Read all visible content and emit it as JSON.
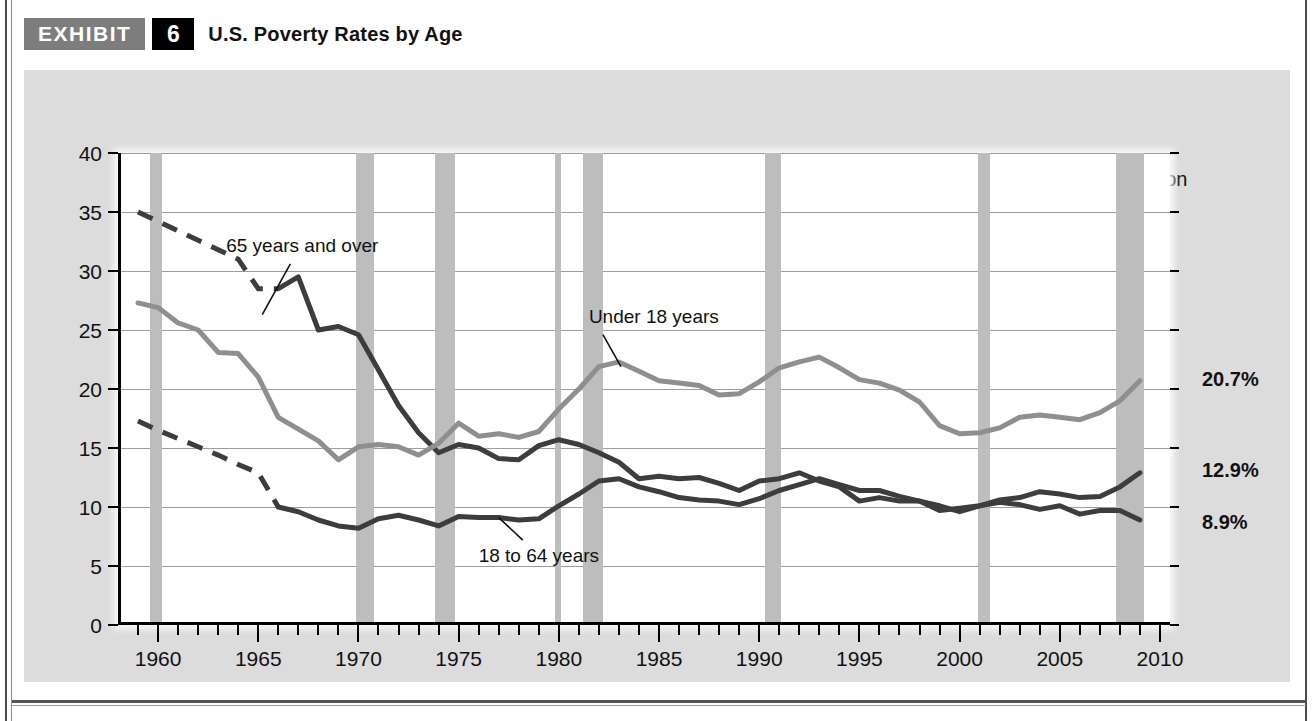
{
  "header": {
    "exhibit_label": "EXHIBIT",
    "exhibit_number": "6",
    "title": "U.S. Poverty Rates by Age"
  },
  "legend": {
    "recession_label": "Recession",
    "recession_color": "#bdbdbd"
  },
  "annotations": {
    "axis_note": "Percent",
    "series_65": "65 years and over",
    "series_under18": "Under 18 years",
    "series_18to64": "18 to 64 years",
    "end_under18": "20.7%",
    "end_18to64": "12.9%",
    "end_65": "8.9%"
  },
  "chart_data": {
    "type": "line",
    "title": "U.S. Poverty Rates by Age",
    "xlabel": "",
    "ylabel": "Percent",
    "xlim": [
      1958,
      2010.5
    ],
    "ylim": [
      0,
      40
    ],
    "ytick_values": [
      0,
      5,
      10,
      15,
      20,
      25,
      30,
      35,
      40
    ],
    "xtick_values": [
      1960,
      1965,
      1970,
      1975,
      1980,
      1985,
      1990,
      1995,
      2000,
      2005,
      2010
    ],
    "xtick_labels": [
      "1960",
      "1965",
      "1970",
      "1975",
      "1980",
      "1985",
      "1990",
      "1995",
      "2000",
      "2005",
      "2010"
    ],
    "grid": "horizontal",
    "legend_position": "top-right",
    "series": [
      {
        "name": "65 years and over",
        "color": "#3d3d3d",
        "width": 5,
        "dashed_until": 1966,
        "end_value_label": "8.9%",
        "x": [
          1959,
          1960,
          1961,
          1962,
          1963,
          1964,
          1965,
          1966,
          1967,
          1968,
          1969,
          1970,
          1971,
          1972,
          1973,
          1974,
          1975,
          1976,
          1977,
          1978,
          1979,
          1980,
          1981,
          1982,
          1983,
          1984,
          1985,
          1986,
          1987,
          1988,
          1989,
          1990,
          1991,
          1992,
          1993,
          1994,
          1995,
          1996,
          1997,
          1998,
          1999,
          2000,
          2001,
          2002,
          2003,
          2004,
          2005,
          2006,
          2007,
          2008,
          2009
        ],
        "y": [
          35.0,
          34.2,
          33.4,
          32.6,
          31.8,
          31.0,
          28.5,
          28.5,
          29.5,
          25.0,
          25.3,
          24.6,
          21.6,
          18.6,
          16.3,
          14.6,
          15.3,
          15.0,
          14.1,
          14.0,
          15.2,
          15.7,
          15.3,
          14.6,
          13.8,
          12.4,
          12.6,
          12.4,
          12.5,
          12.0,
          11.4,
          12.2,
          12.4,
          12.9,
          12.2,
          11.7,
          10.5,
          10.8,
          10.5,
          10.5,
          9.7,
          9.9,
          10.1,
          10.4,
          10.2,
          9.8,
          10.1,
          9.4,
          9.7,
          9.7,
          8.9
        ]
      },
      {
        "name": "Under 18 years",
        "color": "#8f8f8f",
        "width": 5,
        "dashed_until": null,
        "end_value_label": "20.7%",
        "x": [
          1959,
          1960,
          1961,
          1962,
          1963,
          1964,
          1965,
          1966,
          1967,
          1968,
          1969,
          1970,
          1971,
          1972,
          1973,
          1974,
          1975,
          1976,
          1977,
          1978,
          1979,
          1980,
          1981,
          1982,
          1983,
          1984,
          1985,
          1986,
          1987,
          1988,
          1989,
          1990,
          1991,
          1992,
          1993,
          1994,
          1995,
          1996,
          1997,
          1998,
          1999,
          2000,
          2001,
          2002,
          2003,
          2004,
          2005,
          2006,
          2007,
          2008,
          2009
        ],
        "y": [
          27.3,
          26.9,
          25.6,
          25.0,
          23.1,
          23.0,
          21.0,
          17.6,
          16.6,
          15.6,
          14.0,
          15.1,
          15.3,
          15.1,
          14.4,
          15.4,
          17.1,
          16.0,
          16.2,
          15.9,
          16.4,
          18.3,
          20.0,
          21.9,
          22.3,
          21.5,
          20.7,
          20.5,
          20.3,
          19.5,
          19.6,
          20.6,
          21.8,
          22.3,
          22.7,
          21.8,
          20.8,
          20.5,
          19.9,
          18.9,
          16.9,
          16.2,
          16.3,
          16.7,
          17.6,
          17.8,
          17.6,
          17.4,
          18.0,
          19.0,
          20.7
        ]
      },
      {
        "name": "18 to 64 years",
        "color": "#3d3d3d",
        "width": 5,
        "dashed_until": 1966,
        "end_value_label": "12.9%",
        "x": [
          1959,
          1960,
          1961,
          1962,
          1963,
          1964,
          1965,
          1966,
          1967,
          1968,
          1969,
          1970,
          1971,
          1972,
          1973,
          1974,
          1975,
          1976,
          1977,
          1978,
          1979,
          1980,
          1981,
          1982,
          1983,
          1984,
          1985,
          1986,
          1987,
          1988,
          1989,
          1990,
          1991,
          1992,
          1993,
          1994,
          1995,
          1996,
          1997,
          1998,
          1999,
          2000,
          2001,
          2002,
          2003,
          2004,
          2005,
          2006,
          2007,
          2008,
          2009
        ],
        "y": [
          17.3,
          16.5,
          15.8,
          15.1,
          14.4,
          13.6,
          12.9,
          10.0,
          9.6,
          8.9,
          8.4,
          8.2,
          9.0,
          9.3,
          8.9,
          8.4,
          9.2,
          9.1,
          9.1,
          8.9,
          9.0,
          10.1,
          11.1,
          12.2,
          12.4,
          11.7,
          11.3,
          10.8,
          10.6,
          10.5,
          10.2,
          10.7,
          11.4,
          11.9,
          12.4,
          11.9,
          11.4,
          11.4,
          10.9,
          10.5,
          10.1,
          9.6,
          10.1,
          10.6,
          10.8,
          11.3,
          11.1,
          10.8,
          10.9,
          11.7,
          12.9
        ]
      }
    ],
    "recessions": [
      {
        "start": 1959.6,
        "end": 1960.2
      },
      {
        "start": 1969.9,
        "end": 1970.8
      },
      {
        "start": 1973.8,
        "end": 1974.8
      },
      {
        "start": 1979.8,
        "end": 1980.1
      },
      {
        "start": 1981.2,
        "end": 1982.2
      },
      {
        "start": 1990.3,
        "end": 1991.1
      },
      {
        "start": 2000.9,
        "end": 2001.5
      },
      {
        "start": 2007.8,
        "end": 2009.2
      }
    ]
  }
}
